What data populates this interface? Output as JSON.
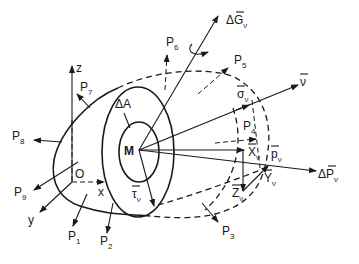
{
  "diagram": {
    "point_M": "M",
    "origin": "O",
    "axes": {
      "x": "x",
      "y": "y",
      "z": "z"
    },
    "area_label": "ΔA",
    "forces": {
      "P1": {
        "main": "P",
        "sub": "1"
      },
      "P2": {
        "main": "P",
        "sub": "2"
      },
      "P3": {
        "main": "P",
        "sub": "3"
      },
      "P4": {
        "main": "P",
        "sub": "4"
      },
      "P5": {
        "main": "P",
        "sub": "5"
      },
      "P6": {
        "main": "P",
        "sub": "6"
      },
      "P7": {
        "main": "P",
        "sub": "7"
      },
      "P8": {
        "main": "P",
        "sub": "8"
      },
      "P9": {
        "main": "P",
        "sub": "9"
      }
    },
    "vectors": {
      "delta_G": {
        "main": "ΔG",
        "sub": "ν"
      },
      "nu": {
        "main": "ν",
        "sub": ""
      },
      "sigma": {
        "main": "σ",
        "sub": "ν"
      },
      "p": {
        "main": "p",
        "sub": "ν"
      },
      "X": {
        "main": "X",
        "sub": "ν"
      },
      "Y": {
        "main": "Y",
        "sub": "ν"
      },
      "Z": {
        "main": "Z",
        "sub": "ν"
      },
      "tau": {
        "main": "τ",
        "sub": "ν"
      },
      "delta_P": {
        "main": "ΔP",
        "sub": "ν"
      }
    },
    "colors": {
      "ink": "#1a1a1a",
      "background": "#ffffff"
    }
  }
}
